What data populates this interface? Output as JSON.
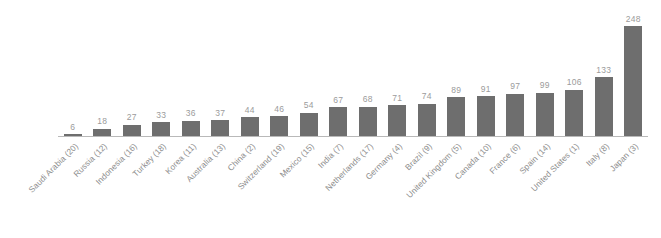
{
  "chart_data": {
    "type": "bar",
    "title": "",
    "subtitle": "",
    "xlabel": "",
    "ylabel": "",
    "ylim": [
      0,
      248
    ],
    "grid": false,
    "legend": null,
    "bar_color": "#6e6e6e",
    "value_label_color": "#9b9b9b",
    "category_label_color": "#8d8d8d",
    "axis_color": "#b9b9b9",
    "categories": [
      "Saudi Arabia (20)",
      "Russia (12)",
      "Indonesia (16)",
      "Turkey (18)",
      "Korea (11)",
      "Australia (13)",
      "China (2)",
      "Switzerland (19)",
      "Mexico (15)",
      "India (7)",
      "Netherlands (17)",
      "Germany (4)",
      "Brazil (9)",
      "United Kingdom (5)",
      "Canada (10)",
      "France (6)",
      "Spain (14)",
      "United States (1)",
      "Italy (8)",
      "Japan (3)"
    ],
    "values": [
      6,
      18,
      27,
      33,
      36,
      37,
      44,
      46,
      54,
      67,
      68,
      71,
      74,
      89,
      91,
      97,
      99,
      106,
      133,
      248
    ],
    "value_labels": [
      "6",
      "18",
      "27",
      "33",
      "36",
      "37",
      "44",
      "46",
      "54",
      "67",
      "68",
      "71",
      "74",
      "89",
      "91",
      "97",
      "99",
      "106",
      "133",
      "248"
    ]
  }
}
